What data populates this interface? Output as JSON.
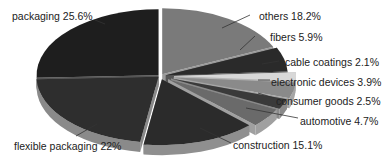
{
  "chart_data": {
    "type": "pie",
    "style": "3d-exploded",
    "title": "",
    "start_angle_deg": 0,
    "direction": "clockwise",
    "slices": [
      {
        "label": "others",
        "value": 18.2,
        "color": "#7a7a7a",
        "side": "#9a9a9a"
      },
      {
        "label": "fibers",
        "value": 5.9,
        "color": "#2a2a2a",
        "side": "#555555"
      },
      {
        "label": "cable coatings",
        "value": 2.1,
        "color": "#d8d8d8",
        "side": "#b5b5b5"
      },
      {
        "label": "electronic devices",
        "value": 3.9,
        "color": "#8a8a8a",
        "side": "#a5a5a5"
      },
      {
        "label": "consumer goods",
        "value": 2.5,
        "color": "#3a3a3a",
        "side": "#8a8a8a"
      },
      {
        "label": "automotive",
        "value": 4.7,
        "color": "#6a6a6a",
        "side": "#a0a0a0"
      },
      {
        "label": "construction",
        "value": 15.1,
        "color": "#2b2b2b",
        "side": "#8f8f8f"
      },
      {
        "label": "flexible packaging",
        "value": 22,
        "color": "#2e2e2e",
        "side": "#8a8a8a"
      },
      {
        "label": "packaging",
        "value": 25.6,
        "color": "#1e1e1e",
        "side": "#555555"
      }
    ],
    "labels": [
      {
        "text": "packaging 25.6%",
        "x": 12,
        "y": 10
      },
      {
        "text": "others 18.2%",
        "x": 259,
        "y": 10
      },
      {
        "text": "fibers 5.9%",
        "x": 270,
        "y": 31
      },
      {
        "text": "cable coatings 2.1%",
        "x": 285,
        "y": 56
      },
      {
        "text": "electronic devices 3.9%",
        "x": 271,
        "y": 76
      },
      {
        "text": "consumer goods 2.5%",
        "x": 276,
        "y": 95
      },
      {
        "text": "automotive 4.7%",
        "x": 300,
        "y": 115
      },
      {
        "text": "construction 15.1%",
        "x": 233,
        "y": 139
      },
      {
        "text": "flexible packaging 22%",
        "x": 14,
        "y": 140
      }
    ],
    "legend": "none",
    "grid": false
  }
}
